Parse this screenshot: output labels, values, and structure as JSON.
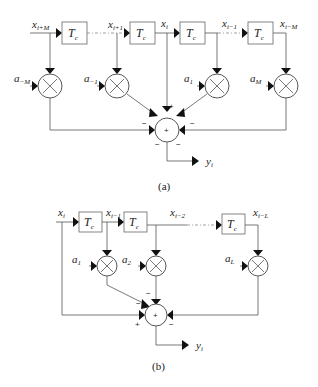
{
  "diagram_a": {
    "caption": "(a)",
    "delay_label": "T",
    "delay_sub": "c",
    "taps": [
      {
        "x_label": "x",
        "x_sub": "i+M",
        "coef": "a",
        "coef_sub": "−M"
      },
      {
        "x_label": "x",
        "x_sub": "i+1",
        "coef": "a",
        "coef_sub": "−1"
      },
      {
        "x_label": "x",
        "x_sub": "i",
        "coef": "",
        "coef_sub": ""
      },
      {
        "x_label": "x",
        "x_sub": "i−1",
        "coef": "a",
        "coef_sub": "1"
      },
      {
        "x_label": "x",
        "x_sub": "i−M",
        "coef": "a",
        "coef_sub": "M"
      }
    ],
    "sum_symbol": "+",
    "signs": {
      "top": "+",
      "upper_left": "−",
      "lower_left": "−",
      "upper_right": "−",
      "lower_right": "−"
    },
    "output": {
      "label": "y",
      "sub": "i"
    }
  },
  "diagram_b": {
    "caption": "(b)",
    "delay_label": "T",
    "delay_sub": "c",
    "taps": [
      {
        "x_label": "x",
        "x_sub": "i"
      },
      {
        "x_label": "x",
        "x_sub": "i−1",
        "coef": "a",
        "coef_sub": "1"
      },
      {
        "x_label": "x",
        "x_sub": "i−2",
        "coef": "a",
        "coef_sub": "2"
      },
      {
        "x_label": "x",
        "x_sub": "i−L",
        "coef": "a",
        "coef_sub": "L"
      }
    ],
    "sum_symbol": "+",
    "signs": {
      "top": "−",
      "upper_left": "−",
      "left": "+",
      "right": "−"
    },
    "output": {
      "label": "y",
      "sub": "i"
    }
  }
}
